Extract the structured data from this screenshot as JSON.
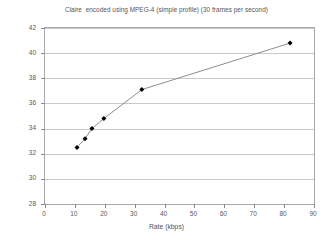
{
  "chart_data": {
    "type": "line",
    "title": "Claire  encoded using MPEG-4 (simple profile) (30 frames per second)",
    "xlabel": "Rate (kbps)",
    "ylabel": "PSNR (dB)",
    "xlim": [
      0,
      90
    ],
    "ylim": [
      28,
      42
    ],
    "xticks": [
      0,
      10,
      20,
      30,
      40,
      50,
      60,
      70,
      80,
      90
    ],
    "yticks": [
      28,
      30,
      32,
      34,
      36,
      38,
      40,
      42
    ],
    "xtick_labels": [
      "0",
      "10",
      "20",
      "30",
      "40",
      "50",
      "60",
      "70",
      "80",
      "90"
    ],
    "ytick_labels": [
      "28",
      "30",
      "32",
      "34",
      "36",
      "38",
      "40",
      "42"
    ],
    "grid": "horizontal",
    "legend": "none",
    "series": [
      {
        "name": "Claire MPEG-4 simple profile",
        "line_color": "#808080",
        "marker_color": "#000000",
        "marker": "diamond",
        "x": [
          10.7,
          13.4,
          15.7,
          19.7,
          32.4,
          82.0
        ],
        "y": [
          32.5,
          33.2,
          34.0,
          34.8,
          37.1,
          40.8
        ]
      }
    ]
  },
  "colors": {
    "frame": "#a9a9a9",
    "grid": "#c9c9c9",
    "text": "#555555",
    "background": "#ffffff"
  }
}
